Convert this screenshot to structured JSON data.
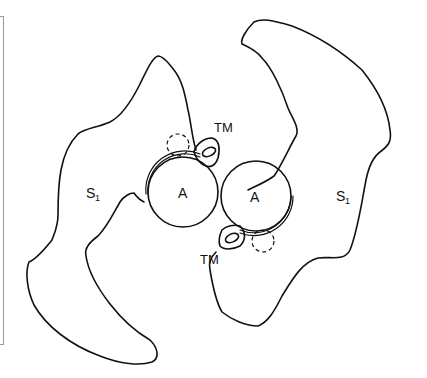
{
  "diagram": {
    "labels": {
      "tm_top": "TM",
      "tm_bottom": "TM",
      "a_left": "A",
      "a_right": "A",
      "s_left_main": "S",
      "s_left_sub": "1",
      "s_right_main": "S",
      "s_right_sub": "1"
    },
    "stroke_color": "#111111",
    "frame_color": "#9a9a9a"
  }
}
